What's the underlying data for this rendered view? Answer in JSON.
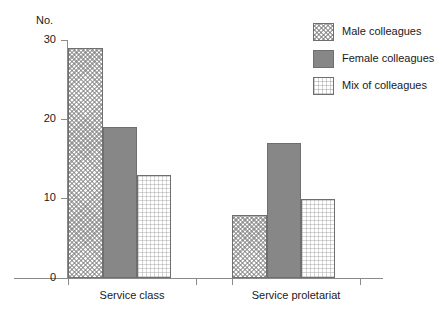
{
  "chart_data": {
    "type": "bar",
    "title": "",
    "subtitle": "",
    "xlabel": "",
    "ylabel": "No.",
    "ylim": [
      0,
      30
    ],
    "yticks": [
      0,
      10,
      20,
      30
    ],
    "ytick_labels": [
      "0",
      "10",
      "20",
      "30"
    ],
    "grid": false,
    "legend_position": "top-right",
    "categories": [
      "Service class",
      "Service proletariat"
    ],
    "series": [
      {
        "name": "Male colleagues",
        "values": [
          29,
          8
        ],
        "pattern": "crosshatch",
        "color": "#fdfdfd"
      },
      {
        "name": "Female colleagues",
        "values": [
          19,
          17
        ],
        "pattern": "solid",
        "color": "#878787"
      },
      {
        "name": "Mix of colleagues",
        "values": [
          13,
          10
        ],
        "pattern": "dotted",
        "color": "#ffffff"
      }
    ]
  },
  "axes": {
    "y_title": "No.",
    "y_ticks": [
      {
        "label": "30",
        "value": 30
      },
      {
        "label": "20",
        "value": 20
      },
      {
        "label": "10",
        "value": 10
      },
      {
        "label": "0",
        "value": 0
      }
    ],
    "x_categories": [
      {
        "label": "Service class"
      },
      {
        "label": "Service proletariat"
      }
    ]
  },
  "legend": {
    "items": [
      {
        "label": "Male colleagues"
      },
      {
        "label": "Female colleagues"
      },
      {
        "label": "Mix of colleagues"
      }
    ]
  },
  "style": {
    "axis_color": "#8a8a8a",
    "bar_border": "#6f6f6f",
    "female_fill": "#878787",
    "text_color": "#1a1a1a",
    "background": "#ffffff"
  }
}
